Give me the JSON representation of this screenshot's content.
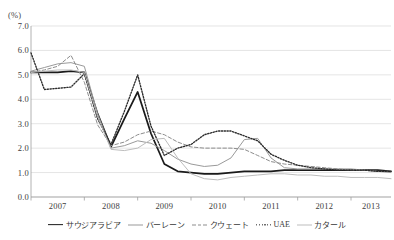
{
  "axis": {
    "unit": "(%)",
    "y_ticks": [
      "7.0",
      "6.0",
      "5.0",
      "4.0",
      "3.0",
      "2.0",
      "1.0",
      "0.0"
    ],
    "x_ticks": [
      "2007",
      "2008",
      "2009",
      "2010",
      "2011",
      "2012",
      "2013"
    ]
  },
  "legend": [
    {
      "label": "サウジアラビア",
      "style": "solid-thick",
      "color": "#1a1a1a",
      "latin": false
    },
    {
      "label": "バーレーン",
      "style": "solid",
      "color": "#9a9a9a",
      "latin": false
    },
    {
      "label": "クウェート",
      "style": "dashed",
      "color": "#8d8d8d",
      "latin": false
    },
    {
      "label": "UAE",
      "style": "dotted",
      "color": "#2b2b2b",
      "latin": true
    },
    {
      "label": "カタール",
      "style": "solid",
      "color": "#bdbdbd",
      "latin": false
    }
  ],
  "chart_data": {
    "type": "line",
    "title": "",
    "xlabel": "",
    "ylabel": "(%)",
    "ylim": [
      0.0,
      7.0
    ],
    "ytick_step": 1.0,
    "grid": "horizontal",
    "legend_position": "bottom",
    "xlim": [
      2007.0,
      2013.75
    ],
    "x": [
      2007.0,
      2007.25,
      2007.5,
      2007.75,
      2008.0,
      2008.25,
      2008.5,
      2008.75,
      2009.0,
      2009.25,
      2009.5,
      2009.75,
      2010.0,
      2010.25,
      2010.5,
      2010.75,
      2011.0,
      2011.25,
      2011.5,
      2011.75,
      2012.0,
      2012.25,
      2012.5,
      2012.75,
      2013.0,
      2013.25,
      2013.5,
      2013.75
    ],
    "xtick_labels": [
      "2007",
      "2008",
      "2009",
      "2010",
      "2011",
      "2012",
      "2013"
    ],
    "series": [
      {
        "name": "サウジアラビア",
        "color": "#1a1a1a",
        "style": "solid-thick",
        "values": [
          5.1,
          5.1,
          5.1,
          5.15,
          5.1,
          3.4,
          2.05,
          3.2,
          4.3,
          2.6,
          1.35,
          1.05,
          1.0,
          0.95,
          0.95,
          1.0,
          1.05,
          1.05,
          1.05,
          1.1,
          1.1,
          1.1,
          1.1,
          1.1,
          1.1,
          1.1,
          1.1,
          1.05
        ]
      },
      {
        "name": "バーレーン",
        "color": "#9a9a9a",
        "style": "solid",
        "values": [
          5.15,
          5.3,
          5.45,
          5.5,
          5.35,
          3.4,
          2.0,
          2.1,
          2.3,
          2.2,
          1.9,
          1.55,
          1.35,
          1.25,
          1.3,
          1.6,
          2.35,
          2.4,
          1.6,
          1.2,
          1.15,
          1.15,
          1.15,
          1.15,
          1.15,
          1.1,
          1.05,
          1.0
        ]
      },
      {
        "name": "クウェート",
        "color": "#8d8d8d",
        "style": "dashed",
        "values": [
          5.1,
          5.2,
          5.35,
          5.8,
          4.7,
          2.95,
          2.1,
          2.25,
          2.55,
          2.7,
          2.55,
          2.25,
          2.05,
          2.0,
          2.0,
          2.0,
          1.95,
          1.7,
          1.45,
          1.35,
          1.3,
          1.25,
          1.2,
          1.15,
          1.1,
          1.1,
          1.05,
          1.05
        ]
      },
      {
        "name": "UAE",
        "color": "#2b2b2b",
        "style": "dotted",
        "values": [
          5.9,
          4.4,
          4.45,
          4.5,
          5.05,
          3.2,
          2.15,
          3.5,
          5.0,
          2.9,
          1.7,
          2.0,
          2.15,
          2.55,
          2.7,
          2.7,
          2.5,
          2.3,
          1.75,
          1.5,
          1.3,
          1.2,
          1.15,
          1.1,
          1.1,
          1.1,
          1.05,
          1.05
        ]
      },
      {
        "name": "カタール",
        "color": "#bdbdbd",
        "style": "solid",
        "values": [
          5.1,
          5.15,
          5.2,
          5.2,
          5.1,
          3.3,
          1.95,
          1.9,
          2.0,
          2.35,
          2.4,
          1.6,
          0.95,
          0.75,
          0.7,
          0.8,
          0.85,
          0.9,
          0.95,
          0.95,
          0.9,
          0.9,
          0.85,
          0.85,
          0.8,
          0.8,
          0.8,
          0.75
        ]
      }
    ]
  }
}
